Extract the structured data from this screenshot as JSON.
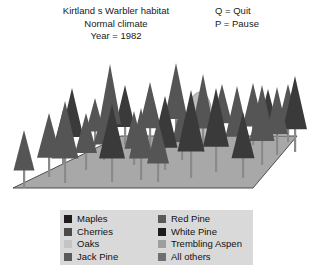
{
  "header": {
    "title_lines": [
      "Kirtland s Warbler habitat",
      "Normal climate",
      "Year = 1982"
    ],
    "title_line1": "Kirtland s Warbler habitat",
    "title_line2": "Normal climate",
    "title_line3": "Year = 1982",
    "keys": [
      "Q = Quit",
      "P = Pause"
    ],
    "key_quit": "Q = Quit",
    "key_pause": "P = Pause"
  },
  "scene": {
    "name": "forest-plot-3d",
    "ground_color": "#a8a8a8",
    "ground_edge_color": "#4d4d4d",
    "background_color": "#ffffff",
    "conifer_color": "#555555",
    "conifer_dark_color": "#3a3a3a",
    "deciduous_color": "#bdbdbd",
    "trunk_color": "#8a8a8a",
    "ground_quad": "13,188 121,136 297,136 253,188",
    "tree_count": 31,
    "trees": [
      {
        "x": 24,
        "y": 188,
        "h": 58,
        "w": 21,
        "shape": "conifer",
        "tone": "mid"
      },
      {
        "x": 49,
        "y": 177,
        "h": 64,
        "w": 24,
        "shape": "conifer",
        "tone": "mid"
      },
      {
        "x": 63,
        "y": 165,
        "h": 55,
        "w": 20,
        "shape": "conifer",
        "tone": "dark"
      },
      {
        "x": 65,
        "y": 183,
        "h": 82,
        "w": 27,
        "shape": "conifer",
        "tone": "mid"
      },
      {
        "x": 72,
        "y": 158,
        "h": 70,
        "w": 23,
        "shape": "conifer",
        "tone": "dark"
      },
      {
        "x": 86,
        "y": 170,
        "h": 57,
        "w": 22,
        "shape": "conifer",
        "tone": "mid"
      },
      {
        "x": 104,
        "y": 160,
        "h": 52,
        "w": 21,
        "shape": "conifer",
        "tone": "mid"
      },
      {
        "x": 112,
        "y": 182,
        "h": 78,
        "w": 26,
        "shape": "conifer",
        "tone": "dark"
      },
      {
        "x": 110,
        "y": 150,
        "h": 86,
        "w": 22,
        "shape": "conifer",
        "tone": "mid"
      },
      {
        "x": 125,
        "y": 145,
        "h": 60,
        "w": 20,
        "shape": "conifer",
        "tone": "dark"
      },
      {
        "x": 141,
        "y": 180,
        "h": 72,
        "w": 24,
        "shape": "conifer",
        "tone": "mid"
      },
      {
        "x": 150,
        "y": 148,
        "h": 66,
        "w": 22,
        "shape": "conifer",
        "tone": "mid"
      },
      {
        "x": 165,
        "y": 170,
        "h": 74,
        "w": 25,
        "shape": "conifer",
        "tone": "dark"
      },
      {
        "x": 176,
        "y": 143,
        "h": 80,
        "w": 23,
        "shape": "conifer",
        "tone": "mid"
      },
      {
        "x": 182,
        "y": 160,
        "h": 60,
        "w": 20,
        "shape": "conifer",
        "tone": "mid"
      },
      {
        "x": 191,
        "y": 178,
        "h": 88,
        "w": 27,
        "shape": "conifer",
        "tone": "dark"
      },
      {
        "x": 200,
        "y": 140,
        "h": 48,
        "w": 24,
        "shape": "deciduous",
        "tone": "light"
      },
      {
        "x": 203,
        "y": 152,
        "h": 78,
        "w": 22,
        "shape": "conifer",
        "tone": "mid"
      },
      {
        "x": 216,
        "y": 172,
        "h": 84,
        "w": 26,
        "shape": "conifer",
        "tone": "dark"
      },
      {
        "x": 222,
        "y": 140,
        "h": 56,
        "w": 20,
        "shape": "conifer",
        "tone": "mid"
      },
      {
        "x": 237,
        "y": 158,
        "h": 72,
        "w": 23,
        "shape": "conifer",
        "tone": "mid"
      },
      {
        "x": 243,
        "y": 178,
        "h": 66,
        "w": 23,
        "shape": "conifer",
        "tone": "dark"
      },
      {
        "x": 253,
        "y": 145,
        "h": 62,
        "w": 21,
        "shape": "conifer",
        "tone": "mid"
      },
      {
        "x": 262,
        "y": 165,
        "h": 80,
        "w": 25,
        "shape": "conifer",
        "tone": "mid"
      },
      {
        "x": 268,
        "y": 139,
        "h": 50,
        "w": 18,
        "shape": "conifer",
        "tone": "dark"
      },
      {
        "x": 277,
        "y": 155,
        "h": 68,
        "w": 22,
        "shape": "conifer",
        "tone": "mid"
      },
      {
        "x": 288,
        "y": 142,
        "h": 58,
        "w": 20,
        "shape": "conifer",
        "tone": "mid"
      },
      {
        "x": 295,
        "y": 152,
        "h": 76,
        "w": 24,
        "shape": "conifer",
        "tone": "dark"
      },
      {
        "x": 134,
        "y": 165,
        "h": 54,
        "w": 19,
        "shape": "conifer",
        "tone": "mid"
      },
      {
        "x": 95,
        "y": 146,
        "h": 48,
        "w": 18,
        "shape": "conifer",
        "tone": "mid"
      },
      {
        "x": 158,
        "y": 182,
        "h": 62,
        "w": 22,
        "shape": "conifer",
        "tone": "mid"
      }
    ]
  },
  "legend": {
    "background_color": "#d9d9d9",
    "left_column": [
      {
        "label": "Maples",
        "color": "#1c1c1c"
      },
      {
        "label": "Cherries",
        "color": "#4a4a4a"
      },
      {
        "label": "Oaks",
        "color": "#c4c4c4"
      },
      {
        "label": "Jack Pine",
        "color": "#5a5a5a"
      }
    ],
    "right_column": [
      {
        "label": "Red Pine",
        "color": "#5a5a5a"
      },
      {
        "label": "White Pine",
        "color": "#1c1c1c"
      },
      {
        "label": "Trembling Aspen",
        "color": "#9e9e9e"
      },
      {
        "label": "All others",
        "color": "#707070"
      }
    ]
  }
}
